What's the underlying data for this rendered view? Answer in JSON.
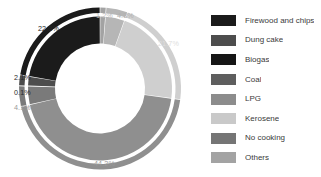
{
  "chart_data": {
    "type": "pie",
    "title": "",
    "subtitle": "",
    "xlabel": "",
    "ylabel": "",
    "legend_position": "right",
    "grid": false,
    "donut": true,
    "start_angle_deg": 0,
    "direction": "clockwise",
    "categories": [
      "Firewood and chips",
      "Dung cake",
      "Biogas",
      "Coal",
      "LPG",
      "Kerosene",
      "No cooking",
      "Others"
    ],
    "values": [
      22.3,
      2.1,
      0.1,
      4.1,
      44.2,
      21.7,
      4.3,
      1.2
    ],
    "units": "%",
    "colors": [
      "#1b1b1b",
      "#4d4d4d",
      "#161616",
      "#5e5e5e",
      "#8c8c8c",
      "#c9c9c9",
      "#757575",
      "#a3a3a3"
    ],
    "slices": [
      {
        "label": "Others",
        "value": 1.2,
        "display": "1.2%",
        "color": "#a3a3a3"
      },
      {
        "label": "No cooking",
        "value": 4.3,
        "display": "4.3%",
        "color": "#b6b6b6"
      },
      {
        "label": "Kerosene",
        "value": 21.7,
        "display": "21.7%",
        "color": "#cfcfcf"
      },
      {
        "label": "LPG",
        "value": 44.2,
        "display": "44.2%",
        "color": "#8f8f8f"
      },
      {
        "label": "Coal",
        "value": 4.1,
        "display": "4.1%",
        "color": "#7a7a7a"
      },
      {
        "label": "Biogas",
        "value": 0.1,
        "display": "0.1%",
        "color": "#161616"
      },
      {
        "label": "Dung cake",
        "value": 2.1,
        "display": "2.1%",
        "color": "#4d4d4d"
      },
      {
        "label": "Firewood and chips",
        "value": 22.3,
        "display": "22.3%",
        "color": "#1b1b1b"
      }
    ],
    "data_labels": {
      "others": "1.2%",
      "no_cooking": "4.3%",
      "kerosene": "21.7%",
      "lpg": "44.2%",
      "coal": "4.1%",
      "biogas": "0.1%",
      "dung_cake": "2.1%",
      "firewood": "22.3%"
    }
  },
  "legend": {
    "items": [
      {
        "label": "Firewood and chips",
        "color": "#1b1b1b"
      },
      {
        "label": "Dung cake",
        "color": "#4d4d4d"
      },
      {
        "label": "Biogas",
        "color": "#161616"
      },
      {
        "label": "Coal",
        "color": "#5e5e5e"
      },
      {
        "label": "LPG",
        "color": "#8c8c8c"
      },
      {
        "label": "Kerosene",
        "color": "#c9c9c9"
      },
      {
        "label": "No cooking",
        "color": "#757575"
      },
      {
        "label": "Others",
        "color": "#a3a3a3"
      }
    ]
  }
}
